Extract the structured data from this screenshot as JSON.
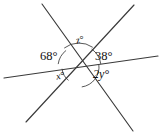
{
  "figure": {
    "background_color": "#ffffff",
    "stroke_color": "#3a3a3a",
    "text_color": "#111111",
    "width": 162,
    "height": 137,
    "intersection": {
      "x": 79,
      "y": 67
    },
    "lines": [
      {
        "name": "line-horizontal",
        "x1": 4,
        "y1": 78,
        "x2": 158,
        "y2": 56
      },
      {
        "name": "line-upper-left-to-lower-right",
        "x1": 42,
        "y1": 4,
        "x2": 133,
        "y2": 131
      },
      {
        "name": "line-lower-left-to-upper-right",
        "x1": 26,
        "y1": 122,
        "x2": 134,
        "y2": 5
      }
    ],
    "arcs": [
      {
        "name": "arc-68",
        "radius": 21,
        "start_deg": 128,
        "end_deg": 172
      },
      {
        "name": "arc-z",
        "radius": 24,
        "start_deg": 55,
        "end_deg": 128
      },
      {
        "name": "arc-38",
        "radius": 22,
        "start_deg": 8,
        "end_deg": 55
      },
      {
        "name": "arc-x",
        "radius": 17,
        "start_deg": 186,
        "end_deg": 232
      },
      {
        "name": "arc-2y",
        "radius": 20,
        "start_deg": 278,
        "end_deg": 352
      }
    ],
    "labels": {
      "angle_68": "68°",
      "angle_38": "38°",
      "angle_z": "z°",
      "angle_x": "x°",
      "angle_2y": "2y°"
    }
  }
}
